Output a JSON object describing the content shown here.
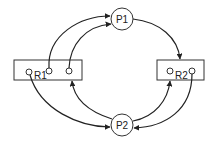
{
  "diagram": {
    "type": "resource-allocation-graph",
    "processes": [
      {
        "id": "P1",
        "label": "P1"
      },
      {
        "id": "P2",
        "label": "P2"
      }
    ],
    "resources": [
      {
        "id": "R1",
        "label": "R1",
        "instances": 3
      },
      {
        "id": "R2",
        "label": "R2",
        "instances": 2
      }
    ],
    "edges": [
      {
        "from": "R1.instance2",
        "to": "P1",
        "kind": "assignment"
      },
      {
        "from": "P1",
        "to": "R1",
        "kind": "request"
      },
      {
        "from": "P1",
        "to": "R2",
        "kind": "request"
      },
      {
        "from": "R1.instance1",
        "to": "P2",
        "kind": "assignment"
      },
      {
        "from": "P2",
        "to": "R1",
        "kind": "request"
      },
      {
        "from": "P2",
        "to": "R2",
        "kind": "request"
      },
      {
        "from": "R2.instance2",
        "to": "P2",
        "kind": "assignment"
      }
    ]
  }
}
